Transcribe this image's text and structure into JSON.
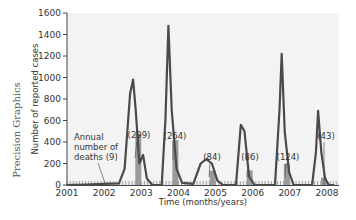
{
  "credit": "Precision Graphics",
  "chart_data": {
    "type": "line",
    "title": "",
    "xlabel": "Time (months/years)",
    "ylabel": "Number of reported cases",
    "ylim": [
      0,
      1600
    ],
    "yticks": [
      0,
      200,
      400,
      600,
      800,
      1000,
      1200,
      1400,
      1600
    ],
    "xticks": [
      "2001",
      "2002",
      "2003",
      "2004",
      "2005",
      "2006",
      "2007",
      "2008"
    ],
    "grid": false,
    "series": [
      {
        "name": "Reported cases (monthly)",
        "points": [
          [
            2001.0,
            0
          ],
          [
            2001.5,
            5
          ],
          [
            2002.0,
            10
          ],
          [
            2002.4,
            15
          ],
          [
            2002.55,
            150
          ],
          [
            2002.7,
            850
          ],
          [
            2002.78,
            980
          ],
          [
            2002.85,
            700
          ],
          [
            2002.95,
            200
          ],
          [
            2003.05,
            280
          ],
          [
            2003.15,
            60
          ],
          [
            2003.3,
            0
          ],
          [
            2003.55,
            0
          ],
          [
            2003.65,
            600
          ],
          [
            2003.73,
            1480
          ],
          [
            2003.82,
            700
          ],
          [
            2003.95,
            150
          ],
          [
            2004.1,
            20
          ],
          [
            2004.4,
            10
          ],
          [
            2004.6,
            200
          ],
          [
            2004.75,
            240
          ],
          [
            2004.9,
            200
          ],
          [
            2005.05,
            40
          ],
          [
            2005.2,
            0
          ],
          [
            2005.55,
            0
          ],
          [
            2005.68,
            560
          ],
          [
            2005.78,
            500
          ],
          [
            2005.9,
            80
          ],
          [
            2006.05,
            0
          ],
          [
            2006.6,
            0
          ],
          [
            2006.72,
            700
          ],
          [
            2006.78,
            1220
          ],
          [
            2006.86,
            500
          ],
          [
            2006.98,
            120
          ],
          [
            2007.1,
            0
          ],
          [
            2007.6,
            0
          ],
          [
            2007.7,
            300
          ],
          [
            2007.76,
            690
          ],
          [
            2007.85,
            300
          ],
          [
            2007.95,
            60
          ],
          [
            2008.05,
            0
          ],
          [
            2008.2,
            0
          ]
        ]
      }
    ],
    "annotations": [
      {
        "text_lines": [
          "Annual",
          "number of",
          "deaths (9)"
        ],
        "year": "2002",
        "deaths": 9
      },
      {
        "text": "(299)",
        "year": "2003",
        "deaths": 299
      },
      {
        "text": "(264)",
        "year": "2004",
        "deaths": 264
      },
      {
        "text": "(84)",
        "year": "2005",
        "deaths": 84
      },
      {
        "text": "(86)",
        "year": "2006",
        "deaths": 86
      },
      {
        "text": "(124)",
        "year": "2007",
        "deaths": 124
      },
      {
        "text": "(43)",
        "year": "2008",
        "deaths": 43
      }
    ],
    "death_bars": [
      {
        "year": "2002",
        "value": 9
      },
      {
        "year": "2003",
        "value": 299
      },
      {
        "year": "2004",
        "value": 264
      },
      {
        "year": "2005",
        "value": 84
      },
      {
        "year": "2006",
        "value": 86
      },
      {
        "year": "2007",
        "value": 124
      },
      {
        "year": "2008",
        "value": 43
      }
    ]
  }
}
